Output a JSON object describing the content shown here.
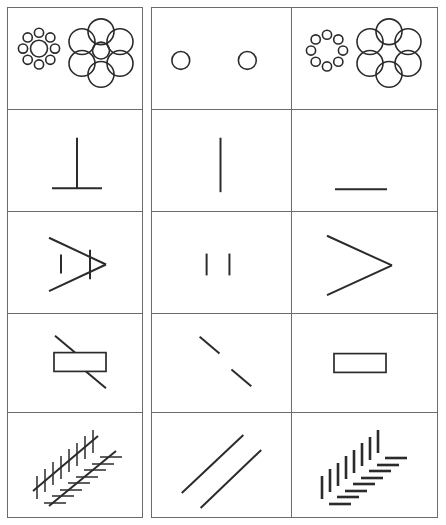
{
  "figure": {
    "title": "Geometric illusion decomposition grid",
    "width": 446,
    "height": 525,
    "background_color": "#ffffff",
    "line_color": "#2b2b2b",
    "border_color": "#6b6b6b"
  },
  "layout": {
    "rows": 5,
    "columns": 3,
    "column_labels": [
      "complete-illusion",
      "targets-only",
      "context-only"
    ],
    "left_block": {
      "x": 7,
      "y": 7,
      "width": 136,
      "height": 511
    },
    "right_block": {
      "x": 151,
      "y": 7,
      "width": 287,
      "height": 511
    },
    "column_divider_x": 292,
    "row_boundaries_y": [
      7,
      110,
      212,
      315,
      415,
      518
    ]
  },
  "rows": [
    {
      "index": 1,
      "illusion_name": "Ebbinghaus",
      "cells": [
        {
          "column": 1,
          "name": "ebbinghaus-complete",
          "content": "small target circle ringed by eight tiny circles, and equal target circle ringed by six large circles"
        },
        {
          "column": 2,
          "name": "ebbinghaus-targets",
          "content": "two equal-sized target circles alone"
        },
        {
          "column": 3,
          "name": "ebbinghaus-context",
          "content": "ring of eight tiny circles and ring of six large circles, targets removed"
        }
      ]
    },
    {
      "index": 2,
      "illusion_name": "Vertical-horizontal (T-figure)",
      "cells": [
        {
          "column": 1,
          "name": "vertical-horizontal-complete",
          "content": "vertical line meeting a horizontal line, forming an inverted T"
        },
        {
          "column": 2,
          "name": "vertical-horizontal-target-vertical",
          "content": "vertical line alone"
        },
        {
          "column": 3,
          "name": "vertical-horizontal-target-horizontal",
          "content": "horizontal line alone"
        }
      ]
    },
    {
      "index": 3,
      "illusion_name": "Muller-Lyer style chevron",
      "cells": [
        {
          "column": 1,
          "name": "chevron-complete",
          "content": "chevron with short vertical test line inside and small vertical bar at apex"
        },
        {
          "column": 2,
          "name": "chevron-targets",
          "content": "two short vertical test lines alone"
        },
        {
          "column": 3,
          "name": "chevron-context",
          "content": "chevron outline alone"
        }
      ]
    },
    {
      "index": 4,
      "illusion_name": "Poggendorff",
      "cells": [
        {
          "column": 1,
          "name": "poggendorff-complete",
          "content": "rectangle interrupting an oblique line, two oblique segments emerging above-left and below-right"
        },
        {
          "column": 2,
          "name": "poggendorff-targets",
          "content": "two collinear oblique segments with the rectangle removed"
        },
        {
          "column": 3,
          "name": "poggendorff-context",
          "content": "rectangle alone"
        }
      ]
    },
    {
      "index": 5,
      "illusion_name": "Zollner",
      "cells": [
        {
          "column": 1,
          "name": "zollner-complete",
          "content": "two parallel oblique lines crossed by vertical hatch marks on the upper line and horizontal hatch marks on the lower line"
        },
        {
          "column": 2,
          "name": "zollner-targets",
          "content": "two plain parallel oblique lines"
        },
        {
          "column": 3,
          "name": "zollner-context",
          "content": "vertical and horizontal hatch marks alone, parallel lines removed"
        }
      ]
    }
  ]
}
